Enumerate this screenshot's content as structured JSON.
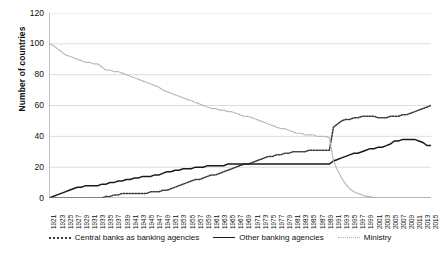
{
  "chart_data": {
    "type": "line",
    "title": "",
    "xlabel": "",
    "ylabel": "Number of countries",
    "ylim": [
      0,
      120
    ],
    "yticks": [
      0,
      20,
      40,
      60,
      80,
      100,
      120
    ],
    "grid": true,
    "legend_position": "bottom",
    "x_range": [
      1921,
      2015
    ],
    "x_tick_step": 2,
    "x": [
      1921,
      1922,
      1923,
      1924,
      1925,
      1926,
      1927,
      1928,
      1929,
      1930,
      1931,
      1932,
      1933,
      1934,
      1935,
      1936,
      1937,
      1938,
      1939,
      1940,
      1941,
      1942,
      1943,
      1944,
      1945,
      1946,
      1947,
      1948,
      1949,
      1950,
      1951,
      1952,
      1953,
      1954,
      1955,
      1956,
      1957,
      1958,
      1959,
      1960,
      1961,
      1962,
      1963,
      1964,
      1965,
      1966,
      1967,
      1968,
      1969,
      1970,
      1971,
      1972,
      1973,
      1974,
      1975,
      1976,
      1977,
      1978,
      1979,
      1980,
      1981,
      1982,
      1983,
      1984,
      1985,
      1986,
      1987,
      1988,
      1989,
      1990,
      1991,
      1992,
      1993,
      1994,
      1995,
      1996,
      1997,
      1998,
      1999,
      2000,
      2001,
      2002,
      2003,
      2004,
      2005,
      2006,
      2007,
      2008,
      2009,
      2010,
      2011,
      2012,
      2013,
      2014,
      2015
    ],
    "xticks": [
      1921,
      1923,
      1925,
      1927,
      1929,
      1931,
      1933,
      1935,
      1937,
      1939,
      1941,
      1943,
      1945,
      1947,
      1949,
      1951,
      1953,
      1955,
      1957,
      1959,
      1961,
      1963,
      1965,
      1967,
      1969,
      1971,
      1973,
      1975,
      1977,
      1979,
      1981,
      1983,
      1985,
      1987,
      1989,
      1991,
      1993,
      1995,
      1997,
      1999,
      2001,
      2003,
      2005,
      2007,
      2009,
      2011,
      2013,
      2015
    ],
    "series": [
      {
        "name": "Central banks as banking agencies",
        "style": "dotted",
        "color": "#3a3a3a",
        "values": [
          0,
          0,
          0,
          0,
          0,
          0,
          0,
          0,
          0,
          0,
          0,
          0,
          0,
          0,
          1,
          1,
          2,
          2,
          3,
          3,
          3,
          3,
          3,
          3,
          3,
          4,
          4,
          4,
          5,
          5,
          6,
          7,
          8,
          9,
          10,
          11,
          12,
          12,
          13,
          14,
          15,
          15,
          16,
          17,
          18,
          19,
          20,
          21,
          22,
          22,
          23,
          24,
          25,
          26,
          27,
          27,
          28,
          28,
          29,
          29,
          30,
          30,
          30,
          30,
          31,
          31,
          31,
          31,
          31,
          31,
          46,
          48,
          50,
          51,
          51,
          52,
          52,
          53,
          53,
          53,
          53,
          52,
          52,
          52,
          53,
          53,
          53,
          54,
          54,
          55,
          56,
          57,
          58,
          59,
          60
        ]
      },
      {
        "name": "Other banking agencies",
        "style": "solid",
        "color": "#1a1a1a",
        "values": [
          0,
          1,
          2,
          3,
          4,
          5,
          6,
          7,
          7,
          8,
          8,
          8,
          8,
          9,
          9,
          10,
          10,
          11,
          11,
          12,
          12,
          13,
          13,
          14,
          14,
          14,
          15,
          15,
          16,
          17,
          17,
          18,
          18,
          19,
          19,
          19,
          20,
          20,
          20,
          21,
          21,
          21,
          21,
          21,
          22,
          22,
          22,
          22,
          22,
          22,
          22,
          22,
          22,
          22,
          22,
          22,
          22,
          22,
          22,
          22,
          22,
          22,
          22,
          22,
          22,
          22,
          22,
          22,
          22,
          22,
          24,
          25,
          26,
          27,
          28,
          29,
          29,
          30,
          31,
          32,
          32,
          33,
          33,
          34,
          35,
          37,
          37,
          38,
          38,
          38,
          38,
          37,
          36,
          34,
          34
        ]
      },
      {
        "name": "Ministry",
        "style": "dotted-light",
        "color": "#b0b0b0",
        "values": [
          100,
          99,
          97,
          95,
          93,
          92,
          91,
          90,
          89,
          88,
          88,
          87,
          87,
          85,
          83,
          83,
          82,
          82,
          81,
          80,
          79,
          78,
          77,
          76,
          75,
          74,
          73,
          72,
          70,
          69,
          68,
          67,
          66,
          65,
          64,
          63,
          62,
          61,
          60,
          59,
          58,
          58,
          57,
          57,
          56,
          56,
          55,
          54,
          53,
          53,
          52,
          51,
          50,
          49,
          48,
          47,
          46,
          45,
          45,
          44,
          43,
          42,
          42,
          41,
          41,
          41,
          40,
          40,
          40,
          39,
          24,
          18,
          13,
          9,
          6,
          4,
          3,
          2,
          1,
          1,
          0,
          0,
          0,
          0,
          0,
          0,
          0,
          0,
          0,
          0,
          0,
          0,
          0,
          0,
          0
        ]
      }
    ]
  },
  "legend": {
    "items": [
      {
        "label": "Central banks as banking agencies",
        "swatch": "dotted-line-icon"
      },
      {
        "label": "Other banking agencies",
        "swatch": "solid-line-icon"
      },
      {
        "label": "Ministry",
        "swatch": "light-dotted-line-icon"
      }
    ]
  }
}
